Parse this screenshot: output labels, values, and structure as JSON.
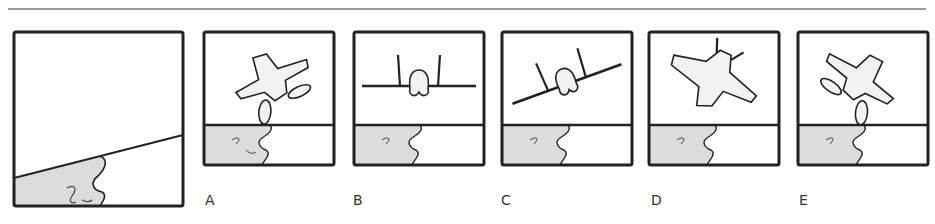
{
  "figure": {
    "reference_panel": {
      "name": "attitude-reference",
      "description": "Banked horizon view"
    },
    "options": [
      {
        "label": "A",
        "aircraft": "top-view-banked-left"
      },
      {
        "label": "B",
        "aircraft": "front-view-level"
      },
      {
        "label": "C",
        "aircraft": "front-view-banked"
      },
      {
        "label": "D",
        "aircraft": "top-view-banked-right"
      },
      {
        "label": "E",
        "aircraft": "top-view-banked-left-mirror"
      }
    ]
  },
  "colors": {
    "stroke": "#222222",
    "land": "#dcdcdc",
    "rule": "#9a9a9a"
  }
}
